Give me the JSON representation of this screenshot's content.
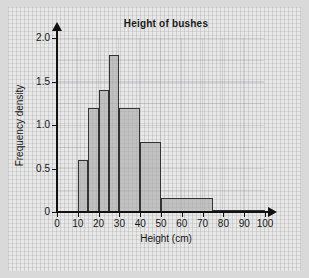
{
  "chart_data": {
    "type": "bar",
    "title": "Height of bushes",
    "xlabel": "Height (cm)",
    "ylabel": "Frequency density",
    "xlim": [
      0,
      100
    ],
    "ylim": [
      0,
      2.0
    ],
    "grid": true,
    "legend": false,
    "xticks": [
      "0",
      "10",
      "20",
      "30",
      "40",
      "50",
      "60",
      "70",
      "80",
      "90",
      "100"
    ],
    "xtick_values": [
      0,
      10,
      20,
      30,
      40,
      50,
      60,
      70,
      80,
      90,
      100
    ],
    "yticks": [
      "0",
      "0.5",
      "1.0",
      "1.5",
      "2.0"
    ],
    "ytick_values": [
      0,
      0.5,
      1.0,
      1.5,
      2.0
    ],
    "bins": [
      {
        "label": "10-15",
        "start": 10,
        "end": 15,
        "value": 0.6
      },
      {
        "label": "15-20",
        "start": 15,
        "end": 20,
        "value": 1.2
      },
      {
        "label": "20-25",
        "start": 20,
        "end": 25,
        "value": 1.4
      },
      {
        "label": "25-30",
        "start": 25,
        "end": 30,
        "value": 1.8
      },
      {
        "label": "30-40",
        "start": 30,
        "end": 40,
        "value": 1.2
      },
      {
        "label": "40-50",
        "start": 40,
        "end": 50,
        "value": 0.8
      },
      {
        "label": "50-75",
        "start": 50,
        "end": 75,
        "value": 0.16
      },
      {
        "label": "75-100",
        "start": 75,
        "end": 100,
        "value": 0.02
      }
    ],
    "bar_fill_color": "#aaaaaa",
    "bar_edge_color": "#333333",
    "background_color": "#e8e8e8",
    "page_color": "#d9d9d9"
  }
}
